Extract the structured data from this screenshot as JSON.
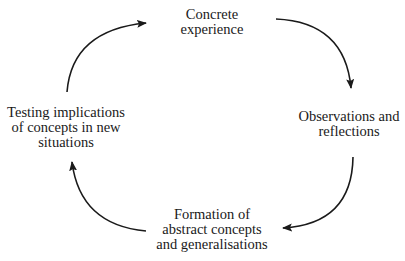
{
  "diagram": {
    "type": "cycle",
    "title": "",
    "nodes": [
      {
        "id": "concrete",
        "position": "top",
        "lines": [
          "Concrete",
          "experience"
        ]
      },
      {
        "id": "observations",
        "position": "right",
        "lines": [
          "Observations and",
          "reflections"
        ]
      },
      {
        "id": "formation",
        "position": "bottom",
        "lines": [
          "Formation of",
          "abstract concepts",
          "and generalisations"
        ]
      },
      {
        "id": "testing",
        "position": "left",
        "lines": [
          "Testing implications",
          "of concepts in new",
          "situations"
        ]
      }
    ],
    "edges": [
      {
        "from": "testing",
        "to": "concrete",
        "direction": "clockwise"
      },
      {
        "from": "concrete",
        "to": "observations",
        "direction": "clockwise"
      },
      {
        "from": "observations",
        "to": "formation",
        "direction": "clockwise"
      },
      {
        "from": "formation",
        "to": "testing",
        "direction": "clockwise"
      }
    ],
    "colors": {
      "text": "#1a1a1a",
      "arrow": "#1a1a1a",
      "background": "#ffffff"
    }
  }
}
